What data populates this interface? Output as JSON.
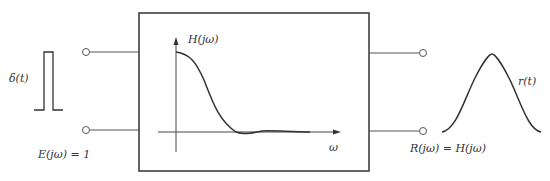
{
  "diagram": {
    "input": {
      "signal_label": "δ(t)",
      "spectrum_label": "E(jω) = 1"
    },
    "system": {
      "transfer_label": "H(jω)",
      "axis_label": "ω"
    },
    "output": {
      "signal_label": "r(t)",
      "spectrum_label": "R(jω) = H(jω)"
    },
    "colors": {
      "stroke": "#333333",
      "background": "#ffffff"
    }
  }
}
